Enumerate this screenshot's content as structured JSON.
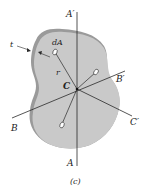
{
  "figure": {
    "caption": "(c)",
    "labels": {
      "axis_a_top": "A′",
      "axis_a_bottom": "A",
      "axis_b_left": "B",
      "axis_b_right": "B′",
      "axis_c_right": "C′",
      "center": "C",
      "radius": "r",
      "area_element": "dA",
      "thickness": "t"
    },
    "colors": {
      "body_fill": "#c9c9c9",
      "body_edge": "#9a9a9a",
      "axis_line": "#2a2a2a",
      "background": "#ffffff"
    }
  }
}
